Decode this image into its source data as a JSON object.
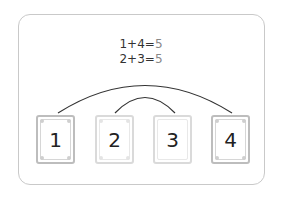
{
  "equations": [
    {
      "left": "1+4=",
      "result": "5"
    },
    {
      "left": "2+3=",
      "result": "5"
    }
  ],
  "cards": [
    {
      "label": "1",
      "style": "normal"
    },
    {
      "label": "2",
      "style": "light"
    },
    {
      "label": "3",
      "style": "light"
    },
    {
      "label": "4",
      "style": "normal"
    }
  ],
  "arcs": [
    {
      "from": "1",
      "to": "4"
    },
    {
      "from": "2",
      "to": "3"
    }
  ],
  "colors": {
    "frame": "#c9c9c9",
    "arc": "#333333",
    "text": "#333333",
    "result": "#888888"
  }
}
